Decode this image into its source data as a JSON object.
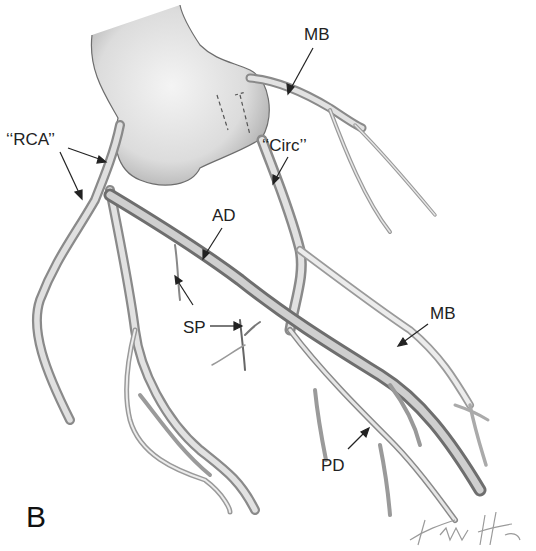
{
  "figure": {
    "panel_letter": "B",
    "labels": [
      {
        "id": "rca",
        "text": "‘‘RCA’’",
        "x": 6,
        "y": 142
      },
      {
        "id": "circ",
        "text": "‘‘Circ’’",
        "x": 262,
        "y": 138
      },
      {
        "id": "mb-top",
        "text": "MB",
        "x": 304,
        "y": 26
      },
      {
        "id": "ad",
        "text": "AD",
        "x": 212,
        "y": 207
      },
      {
        "id": "sp",
        "text": "SP",
        "x": 183,
        "y": 319
      },
      {
        "id": "mb-right",
        "text": "MB",
        "x": 430,
        "y": 305
      },
      {
        "id": "pd",
        "text": "PD",
        "x": 321,
        "y": 457
      }
    ],
    "signature": "Finch",
    "colors": {
      "ink": "#222222",
      "vessel_fill": "#d9d9d9",
      "vessel_shade": "#8a8a8a",
      "heart_fill": "#e6e6e6"
    }
  }
}
